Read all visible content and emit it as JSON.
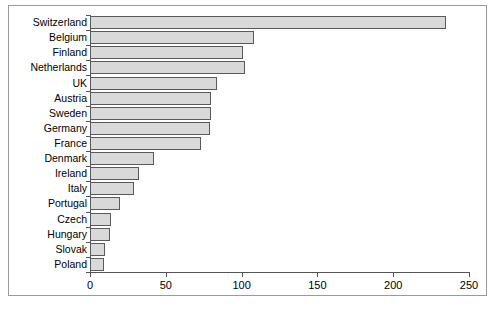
{
  "chart_data": {
    "type": "bar",
    "orientation": "horizontal",
    "title": "",
    "subtitle": "",
    "xlabel": "",
    "ylabel": "",
    "xlim": [
      0,
      250
    ],
    "xticks": [
      0,
      50,
      100,
      150,
      200,
      250
    ],
    "xtick_labels": [
      "0",
      "50",
      "100",
      "150",
      "200",
      "250"
    ],
    "grid": false,
    "legend": null,
    "legend_position": "none",
    "bar_fill_color": "#d9d9d9",
    "bar_border_color": "#5a5a5a",
    "axis_color": "#555555",
    "frame_color": "#9a9a9a",
    "categories": [
      "Switzerland",
      "Belgium",
      "Finland",
      "Netherlands",
      "UK",
      "Austria",
      "Sweden",
      "Germany",
      "France",
      "Denmark",
      "Ireland",
      "Italy",
      "Portugal",
      "Czech",
      "Hungary",
      "Slovak",
      "Poland"
    ],
    "values": [
      235,
      108,
      101,
      102,
      84,
      80,
      80,
      79,
      73,
      42,
      32,
      29,
      20,
      14,
      13,
      10,
      9
    ]
  },
  "caption": ""
}
